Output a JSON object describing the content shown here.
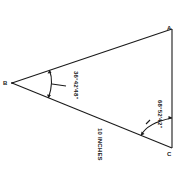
{
  "diagram": {
    "type": "triangle",
    "vertices": [
      {
        "id": "A",
        "label": "A"
      },
      {
        "id": "B",
        "label": "B"
      },
      {
        "id": "C",
        "label": "C"
      }
    ],
    "angles": {
      "B": "36°42'48\"",
      "C": "68°52'42\""
    },
    "sides": {
      "BC": "10 INCHES"
    },
    "colors": {
      "line": "#1a1a1a",
      "background": "#ffffff"
    }
  }
}
